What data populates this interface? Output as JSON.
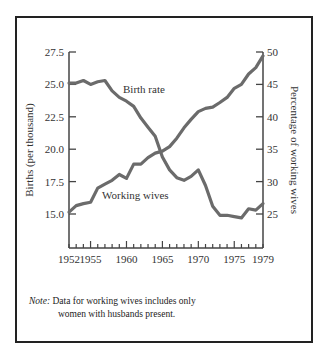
{
  "chart_data": {
    "type": "line",
    "title": "",
    "x": [
      1952,
      1953,
      1954,
      1955,
      1956,
      1957,
      1958,
      1959,
      1960,
      1961,
      1962,
      1963,
      1964,
      1965,
      1966,
      1967,
      1968,
      1969,
      1970,
      1971,
      1972,
      1973,
      1974,
      1975,
      1976,
      1977,
      1978,
      1979
    ],
    "xlabel": "",
    "x_tick_labels": [
      "1952",
      "1955",
      "1960",
      "1965",
      "1970",
      "1975",
      "1979"
    ],
    "xlim": [
      1952,
      1979
    ],
    "ylabel_left": "Births (per thousand)",
    "ylabel_right": "Percentage of working wives",
    "ylim_left": [
      12.4,
      27.5
    ],
    "ylim_right": [
      19.8,
      50
    ],
    "y_left_ticks": [
      "15.0",
      "17.5",
      "20.0",
      "22.5",
      "25.0",
      "27.5"
    ],
    "y_right_ticks": [
      "25",
      "30",
      "35",
      "40",
      "45",
      "50"
    ],
    "grid": false,
    "legend": "inline labels",
    "series": [
      {
        "name": "Birth rate",
        "axis": "left",
        "values": [
          25.1,
          25.1,
          25.3,
          25.0,
          25.2,
          25.3,
          24.5,
          24.0,
          23.7,
          23.3,
          22.4,
          21.7,
          21.0,
          19.4,
          18.4,
          17.8,
          17.6,
          17.9,
          18.4,
          17.2,
          15.6,
          14.9,
          14.9,
          14.8,
          14.7,
          15.4,
          15.3,
          15.8
        ]
      },
      {
        "name": "Working wives",
        "axis": "right",
        "values": [
          25.3,
          26.3,
          26.6,
          26.8,
          29.0,
          29.6,
          30.2,
          31.1,
          30.5,
          32.7,
          32.7,
          33.7,
          34.4,
          34.7,
          35.4,
          36.7,
          38.3,
          39.6,
          40.8,
          41.3,
          41.5,
          42.2,
          43.0,
          44.4,
          45.0,
          46.6,
          47.6,
          49.4
        ]
      }
    ],
    "line_color": "#6b6b6b",
    "annotation": {
      "note_label": "Note:",
      "note_line1": "Data for working wives includes only",
      "note_line2": "women with husbands present."
    }
  }
}
